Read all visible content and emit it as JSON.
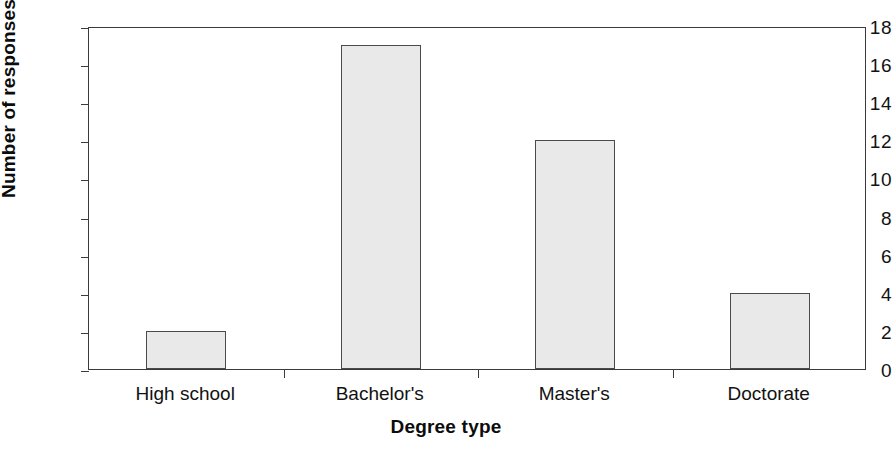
{
  "chart_data": {
    "type": "bar",
    "title": "",
    "subtitle": "",
    "xlabel": "Degree type",
    "ylabel": "Number of responses",
    "categories": [
      "High school",
      "Bachelor's",
      "Master's",
      "Doctorate"
    ],
    "values": [
      2,
      17,
      12,
      4
    ],
    "ylim": [
      0,
      18
    ],
    "y_ticks": [
      0,
      2,
      4,
      6,
      8,
      10,
      12,
      14,
      16,
      18
    ],
    "y_tick_labels": [
      "0",
      "2",
      "4",
      "6",
      "8",
      "10",
      "12",
      "14",
      "16",
      "18"
    ],
    "grid": false,
    "legend": false,
    "legend_position": "none",
    "bar_fill_color": "#e9e9e9",
    "bar_border_color": "#4a4a4a",
    "axis_color": "#3a3a3a",
    "background_color": "#ffffff",
    "text_color": "#121212"
  },
  "axes": {
    "y_title": "Number of responses",
    "x_title": "Degree type"
  }
}
